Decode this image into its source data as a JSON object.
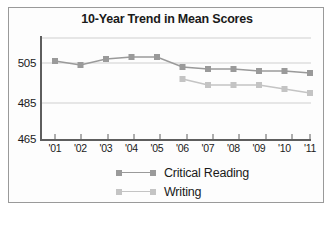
{
  "chart_data": {
    "type": "line",
    "title": "10-Year Trend in Mean Scores",
    "xlabel": "",
    "ylabel": "",
    "categories": [
      "'01",
      "'02",
      "'03",
      "'04",
      "'05",
      "'06",
      "'07",
      "'08",
      "'09",
      "'10",
      "'11"
    ],
    "yticks": [
      465,
      485,
      505
    ],
    "ylim": [
      465,
      515
    ],
    "grid": true,
    "legend_position": "bottom",
    "series": [
      {
        "name": "Critical Reading",
        "color": "#9a9a9a",
        "values": [
          506,
          504,
          507,
          508,
          508,
          503,
          502,
          502,
          501,
          501,
          500
        ]
      },
      {
        "name": "Writing",
        "color": "#c4c4c4",
        "values": [
          null,
          null,
          null,
          null,
          null,
          497,
          494,
          494,
          494,
          492,
          490
        ]
      }
    ]
  },
  "axis": {
    "y_tick_505": "505",
    "y_tick_485": "485",
    "y_tick_465": "465"
  },
  "legend": {
    "items": [
      {
        "label": "Critical Reading"
      },
      {
        "label": "Writing"
      }
    ]
  }
}
